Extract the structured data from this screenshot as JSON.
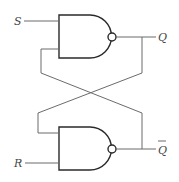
{
  "diagram": {
    "type": "SR latch (cross-coupled NAND gates)",
    "inputs": [
      {
        "id": "S",
        "label": "S"
      },
      {
        "id": "R",
        "label": "R"
      }
    ],
    "outputs": [
      {
        "id": "Q",
        "label": "Q"
      },
      {
        "id": "Qbar",
        "label": "Q",
        "overline": true
      }
    ],
    "gates": [
      {
        "id": "top-nand",
        "kind": "NAND",
        "inputs": [
          "S",
          "Qbar-feedback"
        ],
        "output": "Q"
      },
      {
        "id": "bottom-nand",
        "kind": "NAND",
        "inputs": [
          "Q-feedback",
          "R"
        ],
        "output": "Qbar"
      }
    ],
    "colors": {
      "wire": "#6b6b6b",
      "gate": "#2a2a2a",
      "label": "#444444",
      "background": "#ffffff"
    }
  }
}
